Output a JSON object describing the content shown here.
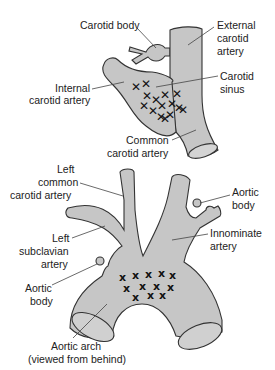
{
  "colors": {
    "vessel_fill": "#c6c6c6",
    "outline": "#333333",
    "text": "#222222",
    "background": "#ffffff"
  },
  "top_diagram": {
    "title": "Carotid bifurcation",
    "labels": {
      "carotid_body": "Carotid body",
      "external_carotid_1": "External",
      "external_carotid_2": "carotid",
      "external_carotid_3": "artery",
      "internal_carotid_1": "Internal",
      "internal_carotid_2": "carotid artery",
      "carotid_sinus_1": "Carotid",
      "carotid_sinus_2": "sinus",
      "common_carotid_1": "Common",
      "common_carotid_2": "carotid artery"
    },
    "receptor_marker": "✕",
    "receptor_count": 15
  },
  "bottom_diagram": {
    "title": "Aortic arch",
    "labels": {
      "left_common_1": "Left",
      "left_common_2": "common",
      "left_common_3": "carotid artery",
      "aortic_body_right_1": "Aortic",
      "aortic_body_right_2": "body",
      "left_subclavian_1": "Left",
      "left_subclavian_2": "subclavian",
      "left_subclavian_3": "artery",
      "innominate_1": "Innominate",
      "innominate_2": "artery",
      "aortic_body_left_1": "Aortic",
      "aortic_body_left_2": "body",
      "aortic_arch_1": "Aortic arch",
      "aortic_arch_2": "(viewed from behind)"
    },
    "receptor_marker": "x",
    "receptor_count": 13
  }
}
